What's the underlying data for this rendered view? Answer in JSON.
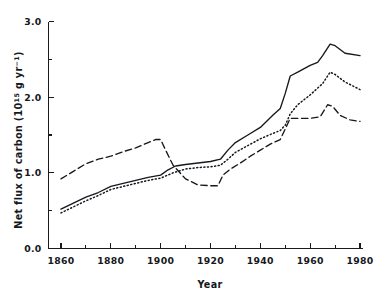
{
  "chart_data": {
    "type": "line",
    "title": "",
    "subtitle": "",
    "xlabel": "Year",
    "ylabel": "Net flux of carbon (10¹⁵ g yr⁻¹)",
    "ylabel_parts": {
      "prefix": "Net flux of carbon (10",
      "sup1": "15",
      "mid": " g yr",
      "sup2": "−1",
      "suffix": ")"
    },
    "xlim": [
      1855,
      1981
    ],
    "ylim": [
      0.0,
      3.0
    ],
    "grid": false,
    "legend": "none",
    "x_major_ticks": [
      1860,
      1880,
      1900,
      1920,
      1940,
      1960,
      1980
    ],
    "x_tick_labels": [
      "1860",
      "1880",
      "1900",
      "1920",
      "1940",
      "1960",
      "1980"
    ],
    "x_minor_ticks": [
      1870,
      1890,
      1910,
      1930,
      1950,
      1970
    ],
    "y_major_ticks": [
      0.0,
      1.0,
      2.0,
      3.0
    ],
    "y_tick_labels": [
      "0.0",
      "1.0",
      "2.0",
      "3.0"
    ],
    "y_minor_ticks": [
      0.5,
      1.5,
      2.5
    ],
    "series": [
      {
        "name": "solid-curve",
        "style": "solid",
        "color": "#15181c",
        "x": [
          1860,
          1865,
          1870,
          1875,
          1880,
          1885,
          1890,
          1895,
          1900,
          1903,
          1906,
          1910,
          1915,
          1920,
          1924,
          1927,
          1930,
          1935,
          1940,
          1945,
          1948,
          1950,
          1952,
          1955,
          1960,
          1963,
          1965,
          1968,
          1970,
          1974,
          1980
        ],
        "values": [
          0.52,
          0.6,
          0.68,
          0.74,
          0.82,
          0.86,
          0.9,
          0.94,
          0.97,
          1.04,
          1.09,
          1.11,
          1.13,
          1.15,
          1.18,
          1.3,
          1.4,
          1.5,
          1.6,
          1.76,
          1.85,
          2.05,
          2.28,
          2.33,
          2.42,
          2.46,
          2.55,
          2.7,
          2.68,
          2.58,
          2.55
        ]
      },
      {
        "name": "dotted-curve",
        "style": "dotted",
        "color": "#15181c",
        "x": [
          1860,
          1865,
          1870,
          1875,
          1880,
          1885,
          1890,
          1895,
          1900,
          1905,
          1910,
          1915,
          1920,
          1924,
          1927,
          1930,
          1935,
          1940,
          1945,
          1948,
          1950,
          1952,
          1955,
          1960,
          1965,
          1968,
          1970,
          1974,
          1980
        ],
        "values": [
          0.47,
          0.55,
          0.63,
          0.7,
          0.78,
          0.82,
          0.86,
          0.9,
          0.93,
          1.0,
          1.05,
          1.07,
          1.08,
          1.1,
          1.18,
          1.27,
          1.36,
          1.45,
          1.52,
          1.56,
          1.63,
          1.78,
          1.9,
          2.03,
          2.18,
          2.33,
          2.3,
          2.2,
          2.1
        ]
      },
      {
        "name": "dashed-curve",
        "style": "dashed",
        "color": "#15181c",
        "x": [
          1860,
          1865,
          1870,
          1875,
          1880,
          1885,
          1890,
          1895,
          1898,
          1900,
          1902,
          1905,
          1910,
          1915,
          1920,
          1923,
          1925,
          1928,
          1932,
          1936,
          1940,
          1944,
          1948,
          1950,
          1952,
          1955,
          1960,
          1964,
          1967,
          1969,
          1972,
          1976,
          1980
        ],
        "values": [
          0.92,
          1.02,
          1.12,
          1.18,
          1.22,
          1.28,
          1.33,
          1.4,
          1.44,
          1.44,
          1.3,
          1.1,
          0.92,
          0.84,
          0.83,
          0.83,
          0.97,
          1.05,
          1.13,
          1.22,
          1.3,
          1.38,
          1.44,
          1.58,
          1.72,
          1.72,
          1.72,
          1.74,
          1.9,
          1.88,
          1.76,
          1.7,
          1.68
        ]
      }
    ]
  }
}
